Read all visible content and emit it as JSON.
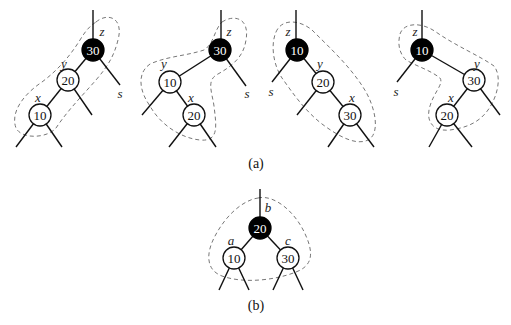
{
  "figure": {
    "caption_a": "(a)",
    "caption_b": "(b)",
    "panels_a": [
      {
        "id": "case-1",
        "nodes": [
          {
            "key": "30",
            "color": "black",
            "label": "z"
          },
          {
            "key": "20",
            "color": "white",
            "label": "y"
          },
          {
            "key": "10",
            "color": "white",
            "label": "x"
          }
        ],
        "sibling_label": "s"
      },
      {
        "id": "case-2",
        "nodes": [
          {
            "key": "30",
            "color": "black",
            "label": "z"
          },
          {
            "key": "10",
            "color": "white",
            "label": "y"
          },
          {
            "key": "20",
            "color": "white",
            "label": "x"
          }
        ],
        "sibling_label": "s"
      },
      {
        "id": "case-3",
        "nodes": [
          {
            "key": "10",
            "color": "black",
            "label": "z"
          },
          {
            "key": "20",
            "color": "white",
            "label": "y"
          },
          {
            "key": "30",
            "color": "white",
            "label": "x"
          }
        ],
        "sibling_label": "s"
      },
      {
        "id": "case-4",
        "nodes": [
          {
            "key": "10",
            "color": "black",
            "label": "z"
          },
          {
            "key": "30",
            "color": "white",
            "label": "y"
          },
          {
            "key": "20",
            "color": "white",
            "label": "x"
          }
        ],
        "sibling_label": "s"
      }
    ],
    "panel_b": {
      "nodes": [
        {
          "key": "20",
          "color": "black",
          "label": "b"
        },
        {
          "key": "10",
          "color": "white",
          "label": "a"
        },
        {
          "key": "30",
          "color": "white",
          "label": "c"
        }
      ]
    },
    "colors": {
      "black_node": "#000000",
      "white_node": "#ffffff",
      "edge": "#111111",
      "dashed_outline": "#777777"
    }
  }
}
